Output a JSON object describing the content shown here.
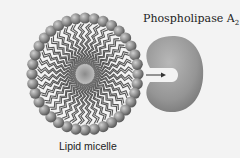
{
  "diagram": {
    "enzyme_label": "Phospholipase A",
    "enzyme_subscript": "2",
    "micelle_label": "Lipid micelle",
    "micelle": {
      "cx": 85,
      "cy": 74,
      "rx": 53,
      "ry": 56,
      "head_count": 36,
      "head_radius": 5.6
    },
    "colors": {
      "background": "#f3f3f3",
      "head": "#8a8a8a",
      "tail": "#555555",
      "core": "#8f8f8f",
      "enzyme": "#9a9a9a",
      "arrow": "#333333",
      "text": "#222222"
    }
  }
}
